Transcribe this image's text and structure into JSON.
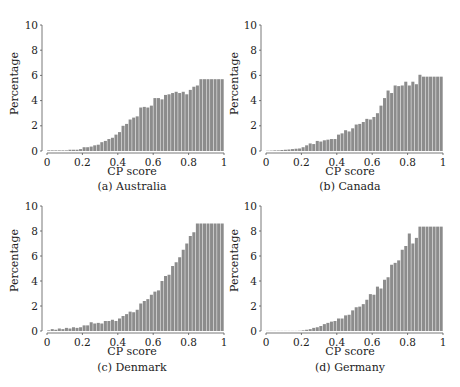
{
  "figure": {
    "panels": [
      {
        "id": "a",
        "caption": "(a) Australia",
        "xlabel": "CP score",
        "ylabel": "Percentage"
      },
      {
        "id": "b",
        "caption": "(b) Canada",
        "xlabel": "CP score",
        "ylabel": "Percentage"
      },
      {
        "id": "c",
        "caption": "(c) Denmark",
        "xlabel": "CP score",
        "ylabel": "Percentage"
      },
      {
        "id": "d",
        "caption": "(d) Germany",
        "xlabel": "CP score",
        "ylabel": "Percentage"
      }
    ],
    "bar_color": "#8c8c8c",
    "axis_color": "#555555"
  },
  "chart_data": [
    {
      "type": "bar",
      "title": "(a) Australia",
      "xlabel": "CP score",
      "ylabel": "Percentage",
      "xlim": [
        0,
        1
      ],
      "ylim": [
        0,
        10
      ],
      "xticks": [
        "0",
        "0.2",
        "0.4",
        "0.6",
        "0.8",
        "1"
      ],
      "yticks": [
        "0",
        "2",
        "4",
        "6",
        "8",
        "10"
      ],
      "bin_width": 0.02,
      "x": [
        0.01,
        0.03,
        0.05,
        0.07,
        0.09,
        0.11,
        0.13,
        0.15,
        0.17,
        0.19,
        0.21,
        0.23,
        0.25,
        0.27,
        0.29,
        0.31,
        0.33,
        0.35,
        0.37,
        0.39,
        0.41,
        0.43,
        0.45,
        0.47,
        0.49,
        0.51,
        0.53,
        0.55,
        0.57,
        0.59,
        0.61,
        0.63,
        0.65,
        0.67,
        0.69,
        0.71,
        0.73,
        0.75,
        0.77,
        0.79,
        0.81,
        0.83,
        0.85,
        0.87,
        0.89,
        0.91,
        0.93,
        0.95,
        0.97,
        0.99
      ],
      "values": [
        0.05,
        0.05,
        0.05,
        0.05,
        0.05,
        0.05,
        0.1,
        0.1,
        0.1,
        0.15,
        0.3,
        0.3,
        0.35,
        0.45,
        0.5,
        0.7,
        0.8,
        0.95,
        1.05,
        1.3,
        1.5,
        2.0,
        2.15,
        2.5,
        2.65,
        2.75,
        3.45,
        3.5,
        3.45,
        3.6,
        4.2,
        4.2,
        4.1,
        4.45,
        4.5,
        4.6,
        4.7,
        4.6,
        4.7,
        4.5,
        4.85,
        5.1,
        5.2,
        5.7,
        5.7,
        5.7,
        5.7,
        5.7,
        5.7,
        5.7
      ],
      "grid": false,
      "legend": null
    },
    {
      "type": "bar",
      "title": "(b) Canada",
      "xlabel": "CP score",
      "ylabel": "Percentage",
      "xlim": [
        0,
        1
      ],
      "ylim": [
        0,
        10
      ],
      "xticks": [
        "0",
        "0.2",
        "0.4",
        "0.6",
        "0.8",
        "1"
      ],
      "yticks": [
        "0",
        "2",
        "4",
        "6",
        "8",
        "10"
      ],
      "bin_width": 0.02,
      "x": [
        0.01,
        0.03,
        0.05,
        0.07,
        0.09,
        0.11,
        0.13,
        0.15,
        0.17,
        0.19,
        0.21,
        0.23,
        0.25,
        0.27,
        0.29,
        0.31,
        0.33,
        0.35,
        0.37,
        0.39,
        0.41,
        0.43,
        0.45,
        0.47,
        0.49,
        0.51,
        0.53,
        0.55,
        0.57,
        0.59,
        0.61,
        0.63,
        0.65,
        0.67,
        0.69,
        0.71,
        0.73,
        0.75,
        0.77,
        0.79,
        0.81,
        0.83,
        0.85,
        0.87,
        0.89,
        0.91,
        0.93,
        0.95,
        0.97,
        0.99
      ],
      "values": [
        0.02,
        0.03,
        0.05,
        0.05,
        0.08,
        0.1,
        0.12,
        0.15,
        0.18,
        0.2,
        0.3,
        0.45,
        0.6,
        0.55,
        0.8,
        0.75,
        0.85,
        0.9,
        0.95,
        0.95,
        1.3,
        1.4,
        1.65,
        1.55,
        1.8,
        2.1,
        2.15,
        2.3,
        2.55,
        2.5,
        2.7,
        3.0,
        3.6,
        4.2,
        4.8,
        4.6,
        5.2,
        5.15,
        5.2,
        5.5,
        5.2,
        5.5,
        5.3,
        6.05,
        5.9,
        5.9,
        5.9,
        5.9,
        5.9,
        5.9
      ],
      "grid": false,
      "legend": null
    },
    {
      "type": "bar",
      "title": "(c) Denmark",
      "xlabel": "CP score",
      "ylabel": "Percentage",
      "xlim": [
        0,
        1
      ],
      "ylim": [
        0,
        10
      ],
      "xticks": [
        "0",
        "0.2",
        "0.4",
        "0.6",
        "0.8",
        "1"
      ],
      "yticks": [
        "0",
        "2",
        "4",
        "6",
        "8",
        "10"
      ],
      "bin_width": 0.02,
      "x": [
        0.01,
        0.03,
        0.05,
        0.07,
        0.09,
        0.11,
        0.13,
        0.15,
        0.17,
        0.19,
        0.21,
        0.23,
        0.25,
        0.27,
        0.29,
        0.31,
        0.33,
        0.35,
        0.37,
        0.39,
        0.41,
        0.43,
        0.45,
        0.47,
        0.49,
        0.51,
        0.53,
        0.55,
        0.57,
        0.59,
        0.61,
        0.63,
        0.65,
        0.67,
        0.69,
        0.71,
        0.73,
        0.75,
        0.77,
        0.79,
        0.81,
        0.83,
        0.85,
        0.87,
        0.89,
        0.91,
        0.93,
        0.95,
        0.97,
        0.99
      ],
      "values": [
        0.05,
        0.15,
        0.1,
        0.2,
        0.15,
        0.25,
        0.2,
        0.3,
        0.25,
        0.3,
        0.45,
        0.45,
        0.7,
        0.6,
        0.65,
        0.6,
        0.8,
        0.8,
        0.9,
        0.8,
        1.0,
        1.2,
        1.35,
        1.55,
        1.5,
        1.7,
        2.2,
        2.4,
        2.55,
        2.9,
        3.15,
        3.25,
        4.0,
        4.4,
        4.5,
        5.2,
        5.5,
        5.9,
        6.5,
        7.0,
        7.6,
        7.9,
        8.6,
        8.6,
        8.6,
        8.6,
        8.6,
        8.6,
        8.6,
        8.6
      ],
      "grid": false,
      "legend": null
    },
    {
      "type": "bar",
      "title": "(d) Germany",
      "xlabel": "CP score",
      "ylabel": "Percentage",
      "xlim": [
        0,
        1
      ],
      "ylim": [
        0,
        10
      ],
      "xticks": [
        "0",
        "0.2",
        "0.4",
        "0.6",
        "0.8",
        "1"
      ],
      "yticks": [
        "0",
        "2",
        "4",
        "6",
        "8",
        "10"
      ],
      "bin_width": 0.02,
      "x": [
        0.01,
        0.03,
        0.05,
        0.07,
        0.09,
        0.11,
        0.13,
        0.15,
        0.17,
        0.19,
        0.21,
        0.23,
        0.25,
        0.27,
        0.29,
        0.31,
        0.33,
        0.35,
        0.37,
        0.39,
        0.41,
        0.43,
        0.45,
        0.47,
        0.49,
        0.51,
        0.53,
        0.55,
        0.57,
        0.59,
        0.61,
        0.63,
        0.65,
        0.67,
        0.69,
        0.71,
        0.73,
        0.75,
        0.77,
        0.79,
        0.81,
        0.83,
        0.85,
        0.87,
        0.89,
        0.91,
        0.93,
        0.95,
        0.97,
        0.99
      ],
      "values": [
        0.01,
        0.01,
        0.01,
        0.01,
        0.01,
        0.01,
        0.01,
        0.01,
        0.01,
        0.02,
        0.05,
        0.1,
        0.15,
        0.25,
        0.3,
        0.4,
        0.55,
        0.65,
        0.75,
        0.8,
        1.0,
        1.0,
        1.25,
        1.3,
        1.65,
        1.9,
        1.95,
        2.15,
        2.5,
        2.95,
        2.9,
        3.55,
        3.4,
        4.1,
        4.3,
        5.3,
        5.45,
        5.65,
        6.5,
        6.8,
        7.8,
        7.0,
        7.45,
        8.35,
        8.35,
        8.35,
        8.35,
        8.35,
        8.35,
        8.35
      ],
      "grid": false,
      "legend": null
    }
  ]
}
